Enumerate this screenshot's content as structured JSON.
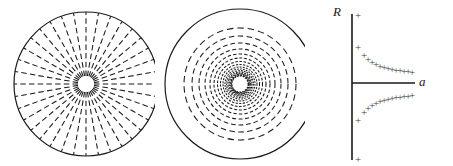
{
  "figure": {
    "caption": "",
    "background_color": "#ffffff",
    "stroke_color": "#1a1a1a",
    "marker_color": "#3c3c46",
    "panels": [
      {
        "id": "panel-radial",
        "name": "radial-spokes-disk",
        "type": "polar-diagram",
        "description": "Circle with radial dashed spokes from a small central hole to the rim",
        "center": [
          86,
          84
        ],
        "outer_radius": 72,
        "inner_hole_radius": 8,
        "spoke_count": 36,
        "spoke_angle_step_deg": 10,
        "spoke_style": "dashed",
        "outer_circle_style": "solid"
      },
      {
        "id": "panel-rings",
        "name": "concentric-rings-disk",
        "type": "polar-diagram",
        "description": "Large solid circle containing concentric dashed rings that crowd toward the centre",
        "center": [
          85,
          84
        ],
        "outer_radius": 75,
        "inner_hole_radius": 7,
        "outer_circle_style": "solid",
        "ring_style": "dashed",
        "ring_radii": [
          56,
          48,
          41,
          35,
          30,
          26,
          22.5,
          19.5,
          17,
          15,
          13.4,
          12,
          10.9,
          10,
          9.2,
          8.6,
          8.1
        ]
      },
      {
        "id": "panel-scatter",
        "name": "r-versus-a-scatter",
        "type": "scatter",
        "description": "Two symmetric branches of plus markers approaching the horizontal axis, plus isolated markers at the top and bottom of the vertical axis"
      }
    ]
  },
  "chart_data": {
    "type": "scatter",
    "title": "",
    "xlabel": "a",
    "ylabel": "R",
    "marker": "+",
    "grid": false,
    "legend": null,
    "axes": {
      "vertical_axis_x": 52,
      "vertical_axis_y_top": 14,
      "vertical_axis_y_bottom": 160,
      "horizontal_axis_y": 83,
      "horizontal_axis_x_start": 52,
      "horizontal_axis_x_end": 115,
      "origin_px": [
        52,
        83
      ]
    },
    "label_positions": {
      "ylabel_px": [
        33,
        16
      ],
      "xlabel_px": [
        119,
        86
      ]
    },
    "series": [
      {
        "name": "upper-branch",
        "points_px": [
          [
            58,
            47
          ],
          [
            64,
            55
          ],
          [
            68,
            59
          ],
          [
            72,
            62
          ],
          [
            76,
            64
          ],
          [
            80,
            66
          ],
          [
            84,
            67
          ],
          [
            88,
            68
          ],
          [
            92,
            69
          ],
          [
            96,
            70
          ],
          [
            100,
            70
          ],
          [
            104,
            71
          ],
          [
            108,
            71
          ],
          [
            112,
            72
          ]
        ]
      },
      {
        "name": "lower-branch",
        "points_px": [
          [
            58,
            120
          ],
          [
            64,
            112
          ],
          [
            68,
            108
          ],
          [
            72,
            105
          ],
          [
            76,
            103
          ],
          [
            80,
            101
          ],
          [
            84,
            100
          ],
          [
            88,
            99
          ],
          [
            92,
            98
          ],
          [
            96,
            97
          ],
          [
            100,
            97
          ],
          [
            104,
            96
          ],
          [
            108,
            96
          ],
          [
            112,
            95
          ]
        ]
      },
      {
        "name": "axis-endpoint-markers",
        "points_px": [
          [
            58,
            15
          ],
          [
            58,
            159
          ]
        ]
      }
    ]
  }
}
